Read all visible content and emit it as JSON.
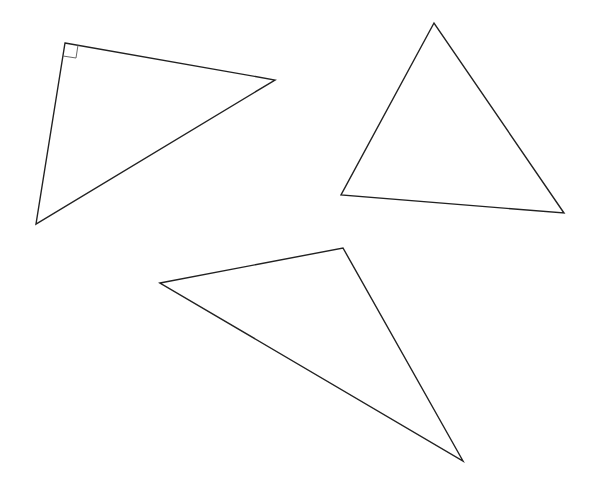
{
  "canvas": {
    "width": 594,
    "height": 492,
    "background": "#ffffff"
  },
  "stroke": {
    "color": "#222222",
    "width": 1.4
  },
  "marker_stroke": {
    "color": "#555555",
    "width": 0.9
  },
  "triangles": [
    {
      "name": "right-triangle",
      "points": [
        [
          65,
          43
        ],
        [
          275,
          80
        ],
        [
          36,
          224
        ]
      ],
      "right_angle_marker": [
        [
          65,
          43
        ],
        [
          78,
          45
        ],
        [
          76,
          58
        ],
        [
          63,
          56
        ]
      ]
    },
    {
      "name": "acute-triangle",
      "points": [
        [
          434,
          23
        ],
        [
          341,
          195
        ],
        [
          564,
          213
        ]
      ]
    },
    {
      "name": "obtuse-triangle",
      "points": [
        [
          160,
          283
        ],
        [
          343,
          248
        ],
        [
          463,
          461
        ]
      ]
    }
  ]
}
